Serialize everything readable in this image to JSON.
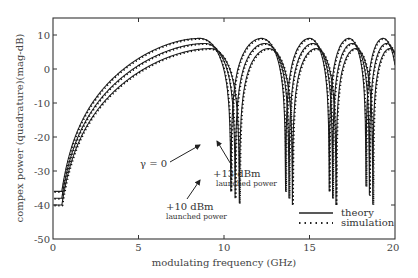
{
  "chart_data": {
    "type": "line",
    "title": "",
    "xlabel": "modulating frequency (GHz)",
    "ylabel": "compex power (quadrature)(mag-dB)",
    "xlim": [
      0,
      20
    ],
    "ylim": [
      -50,
      15
    ],
    "xticks": [
      0,
      5,
      10,
      15,
      20
    ],
    "yticks": [
      10,
      0,
      -10,
      -20,
      -30,
      -40,
      -50
    ],
    "grid": false,
    "legend_position": "lower right",
    "legend": [
      {
        "label": "theory",
        "style": "solid"
      },
      {
        "label": "simulation",
        "style": "dotted"
      }
    ],
    "series": [
      {
        "name": "γ = 0 (theory & simulation)",
        "peak_dB": 9,
        "first_null_GHz": 8.6,
        "nulls_GHz": [
          8.6,
          12.2,
          15.0,
          17.3,
          19.3
        ]
      },
      {
        "name": "+10 dBm launched power (theory & simulation)",
        "peak_dB": 7.5,
        "first_null_GHz": 8.9,
        "nulls_GHz": [
          8.9,
          12.4,
          15.2,
          17.5,
          19.5
        ]
      },
      {
        "name": "+13 dBm launched power (theory & simulation)",
        "peak_dB": 6,
        "first_null_GHz": 9.2,
        "nulls_GHz": [
          9.2,
          12.6,
          15.4,
          17.7,
          19.7
        ]
      }
    ],
    "annotations": [
      {
        "text": "γ = 0",
        "x_GHz": 5.8,
        "y_dB": -23
      },
      {
        "text": "+13 dBm",
        "subtext": "launched power",
        "x_GHz": 10.7,
        "y_dB": -29
      },
      {
        "text": "+10 dBm",
        "subtext": "launched power",
        "x_GHz": 6.7,
        "y_dB": -40
      }
    ]
  },
  "labels": {
    "xlabel": "modulating frequency (GHz)",
    "ylabel": "compex power (quadrature)(mag-dB)",
    "xticks": [
      "0",
      "5",
      "10",
      "15",
      "20"
    ],
    "yticks": [
      "10",
      "0",
      "-10",
      "-20",
      "-30",
      "-40",
      "-50"
    ],
    "ann_gamma": "γ = 0",
    "ann_13": "+13 dBm",
    "ann_13_sub": "launched power",
    "ann_10": "+10 dBm",
    "ann_10_sub": "launched power",
    "legend_theory": "theory",
    "legend_simulation": "simulation"
  }
}
